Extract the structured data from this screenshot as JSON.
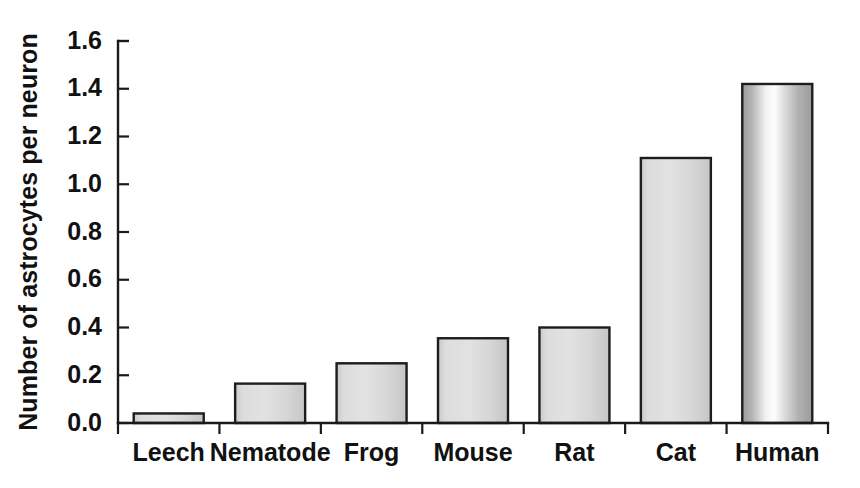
{
  "chart_data": {
    "type": "bar",
    "title": "",
    "subtitle": "",
    "xlabel": "",
    "ylabel": "Number of astrocytes  per neuron",
    "categories": [
      "Leech",
      "Nematode",
      "Frog",
      "Mouse",
      "Rat",
      "Cat",
      "Human"
    ],
    "values": [
      0.04,
      0.165,
      0.25,
      0.355,
      0.4,
      1.11,
      1.42
    ],
    "series": [
      {
        "name": "Astrocytes per neuron",
        "values": [
          0.04,
          0.165,
          0.25,
          0.355,
          0.4,
          1.11,
          1.42
        ]
      }
    ],
    "ylim": [
      0.0,
      1.6
    ],
    "xlim": [
      0,
      7
    ],
    "ytick_labels": [
      "0.0",
      "0.2",
      "0.4",
      "0.6",
      "0.8",
      "1.0",
      "1.2",
      "1.4",
      "1.6"
    ],
    "ytick_values": [
      0.0,
      0.2,
      0.4,
      0.6,
      0.8,
      1.0,
      1.2,
      1.4,
      1.6
    ],
    "ytick_step": 0.2,
    "grid": false,
    "legend": false,
    "legend_position": "none",
    "annotations": [],
    "bar_fill_color": "#d6d6d6",
    "bar_edge_color": "#1d1d1d",
    "bar_highlight_color": "#fcfcfc",
    "bar_shade_color": "#9a9a9a",
    "background_color": "#ffffff",
    "axis_color": "#1a1a1a",
    "text_color": "#111111",
    "gradient_bars": [
      "Human"
    ]
  },
  "layout": {
    "plot_left": 118,
    "plot_right": 828,
    "plot_top": 41,
    "plot_bottom": 423,
    "bar_width": 70,
    "tick_inner_length": 11,
    "tick_outer_length": 11,
    "axis_title_x": 30,
    "axis_title_y": 232
  }
}
